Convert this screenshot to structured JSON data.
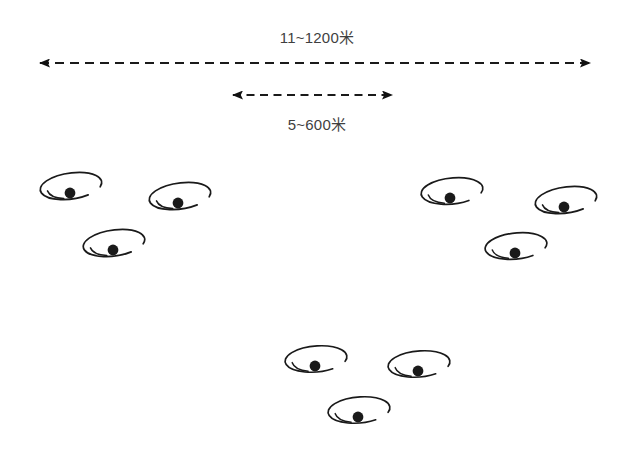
{
  "figure": {
    "background_color": "#ffffff",
    "line_color": "#1a1a1a",
    "text_color": "#3f3f3f",
    "width": 634,
    "height": 457
  },
  "dimensions": [
    {
      "id": "outer-span",
      "label": "11~1200米",
      "label_x": 321,
      "label_y": 26,
      "arrow": {
        "x1": 32,
        "x2": 598,
        "y": 63,
        "style": "dashed",
        "heads": "both"
      }
    },
    {
      "id": "inner-span",
      "label": "5~600米",
      "label_x": 317,
      "label_y": 113,
      "arrow": {
        "x1": 225,
        "x2": 400,
        "y": 95,
        "style": "dashed",
        "heads": "both"
      }
    }
  ],
  "groups": [
    {
      "id": "left-cluster",
      "name": "left-drone-cluster",
      "drones": [
        {
          "id": "drone-l1",
          "cx": 71,
          "cy": 186,
          "rx": 31,
          "ry": 13,
          "dot_x": 70,
          "dot_y": 193,
          "rot": -8
        },
        {
          "id": "drone-l2",
          "cx": 180,
          "cy": 196,
          "rx": 31,
          "ry": 13,
          "dot_x": 178,
          "dot_y": 203,
          "rot": -8
        },
        {
          "id": "drone-l3",
          "cx": 114,
          "cy": 243,
          "rx": 31,
          "ry": 13,
          "dot_x": 113,
          "dot_y": 250,
          "rot": -8
        }
      ]
    },
    {
      "id": "right-cluster",
      "name": "right-drone-cluster",
      "drones": [
        {
          "id": "drone-r1",
          "cx": 452,
          "cy": 191,
          "rx": 31,
          "ry": 13,
          "dot_x": 450,
          "dot_y": 198,
          "rot": -6
        },
        {
          "id": "drone-r2",
          "cx": 566,
          "cy": 200,
          "rx": 31,
          "ry": 13,
          "dot_x": 564,
          "dot_y": 207,
          "rot": -8
        },
        {
          "id": "drone-r3",
          "cx": 516,
          "cy": 246,
          "rx": 31,
          "ry": 13,
          "dot_x": 515,
          "dot_y": 253,
          "rot": -6
        }
      ]
    },
    {
      "id": "bottom-cluster",
      "name": "bottom-drone-cluster",
      "drones": [
        {
          "id": "drone-b1",
          "cx": 316,
          "cy": 359,
          "rx": 31,
          "ry": 13,
          "dot_x": 315,
          "dot_y": 366,
          "rot": -5
        },
        {
          "id": "drone-b2",
          "cx": 419,
          "cy": 364,
          "rx": 31,
          "ry": 13,
          "dot_x": 418,
          "dot_y": 371,
          "rot": -5
        },
        {
          "id": "drone-b3",
          "cx": 359,
          "cy": 410,
          "rx": 31,
          "ry": 13,
          "dot_x": 358,
          "dot_y": 417,
          "rot": -5
        }
      ]
    }
  ]
}
